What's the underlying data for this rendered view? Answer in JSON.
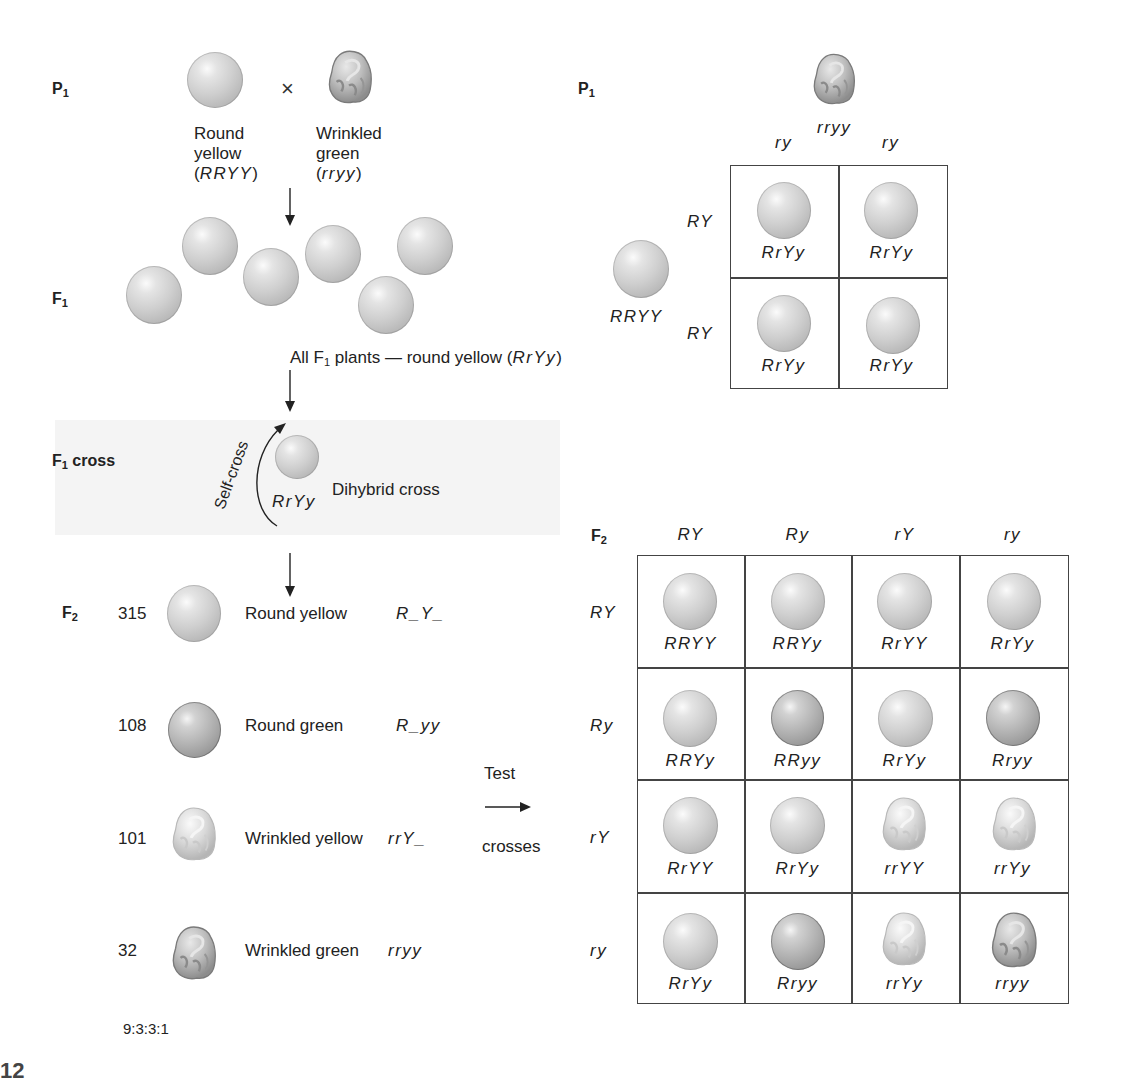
{
  "left_panel": {
    "p1": {
      "generation_label": "P",
      "generation_sub": "1",
      "cross_symbol": "×",
      "parent_a": {
        "phenotype_line1": "Round",
        "phenotype_line2": "yellow",
        "genotype_open": "(",
        "genotype": "RRYY",
        "genotype_close": ")",
        "shape": "round",
        "color": "yellow"
      },
      "parent_b": {
        "phenotype_line1": "Wrinkled",
        "phenotype_line2": "green",
        "genotype_open": "(",
        "genotype": "rryy",
        "genotype_close": ")",
        "shape": "wrinkled",
        "color": "green"
      }
    },
    "f1": {
      "generation_label": "F",
      "generation_sub": "1",
      "pea_count": 6,
      "caption_prefix": "All F",
      "caption_sub": "1",
      "caption_middle": " plants — round yellow (",
      "caption_genotype": "RrYy",
      "caption_close": ")"
    },
    "f1_cross": {
      "label": "F",
      "label_sub": "1",
      "label_suffix": " cross",
      "arc_label": "Self-cross",
      "genotype": "RrYy",
      "description": "Dihybrid cross"
    },
    "f2": {
      "generation_label": "F",
      "generation_sub": "2",
      "rows": [
        {
          "count": "315",
          "phenotype": "Round yellow",
          "genotype": "R_Y_",
          "shape": "round",
          "color": "yellow"
        },
        {
          "count": "108",
          "phenotype": "Round green",
          "genotype": "R_yy",
          "shape": "round",
          "color": "green"
        },
        {
          "count": "101",
          "phenotype": "Wrinkled yellow",
          "genotype": "rrY_",
          "shape": "wrinkled",
          "color": "yellow"
        },
        {
          "count": "32",
          "phenotype": "Wrinkled green",
          "genotype": "rryy",
          "shape": "wrinkled",
          "color": "green"
        }
      ],
      "ratio": "9:3:3:1"
    },
    "test_crosses": {
      "line1": "Test",
      "line2": "crosses"
    }
  },
  "right_panel": {
    "p1_square": {
      "generation_label": "P",
      "generation_sub": "1",
      "top_parent_genotype": "rryy",
      "left_parent_genotype": "RRYY",
      "column_gametes": [
        "ry",
        "ry"
      ],
      "row_gametes": [
        "RY",
        "RY"
      ],
      "cells": [
        [
          "RrYy",
          "RrYy"
        ],
        [
          "RrYy",
          "RrYy"
        ]
      ]
    },
    "f2_square": {
      "generation_label": "F",
      "generation_sub": "2",
      "column_gametes": [
        "RY",
        "Ry",
        "rY",
        "ry"
      ],
      "row_gametes": [
        "RY",
        "Ry",
        "rY",
        "ry"
      ],
      "cells": [
        [
          "RRYY",
          "RRYy",
          "RrYY",
          "RrYy"
        ],
        [
          "RRYy",
          "RRyy",
          "RrYy",
          "Rryy"
        ],
        [
          "RrYY",
          "RrYy",
          "rrYY",
          "rrYy"
        ],
        [
          "RrYy",
          "Rryy",
          "rrYy",
          "rryy"
        ]
      ],
      "cell_types": [
        [
          "round-yellow",
          "round-yellow",
          "round-yellow",
          "round-yellow"
        ],
        [
          "round-yellow",
          "round-green",
          "round-yellow",
          "round-green"
        ],
        [
          "round-yellow",
          "round-yellow",
          "wrinkled-yellow",
          "wrinkled-yellow"
        ],
        [
          "round-yellow",
          "round-green",
          "wrinkled-yellow",
          "wrinkled-green"
        ]
      ]
    }
  },
  "footer": {
    "figure_number_fragment": "12"
  },
  "colors": {
    "line": "#444444",
    "band": "#f4f4f4",
    "text": "#222222"
  }
}
